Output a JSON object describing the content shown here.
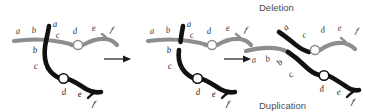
{
  "figure": {
    "title_top": "Deletion",
    "title_bottom": "Duplication",
    "width": 365,
    "height": 112,
    "colors": {
      "gray_chromosome": "#8d8d8d",
      "black_chromosome": "#111111",
      "centromere_fill": "#ffffff",
      "caption_text": "#4d4d4d",
      "background": "#ffffff"
    }
  },
  "panels": [
    {
      "id": "panel-1",
      "name": "paired-homologs-misaligned",
      "gray_chromosome": {
        "labels_left": [
          "a",
          "b"
        ],
        "labels_right": [
          "c",
          "d",
          "e",
          "f"
        ]
      },
      "black_chromosome": {
        "labels_upper": [
          "a"
        ],
        "labels_left": [
          "b",
          "c"
        ],
        "labels_right": [
          "d",
          "e",
          "f"
        ]
      }
    },
    {
      "id": "panel-2",
      "name": "strand-breakage",
      "gray_chromosome": {
        "labels_left": [
          "a",
          "b"
        ],
        "labels_right": [
          "c",
          "d",
          "e",
          "f"
        ]
      },
      "black_chromosome": {
        "labels_upper": [
          "a"
        ],
        "labels_left": [
          "b",
          "c"
        ],
        "labels_right": [
          "d",
          "e",
          "f"
        ]
      }
    },
    {
      "id": "panel-3",
      "name": "recombinant-products",
      "deletion_chromosome": {
        "labels": [
          "a",
          "c",
          "d",
          "e",
          "f"
        ]
      },
      "duplication_chromosome": {
        "labels": [
          "a",
          "b",
          "b",
          "c",
          "d",
          "e",
          "f"
        ]
      }
    }
  ],
  "arrows": [
    {
      "id": "arrow-1",
      "direction": "right"
    },
    {
      "id": "arrow-2",
      "direction": "right"
    }
  ]
}
